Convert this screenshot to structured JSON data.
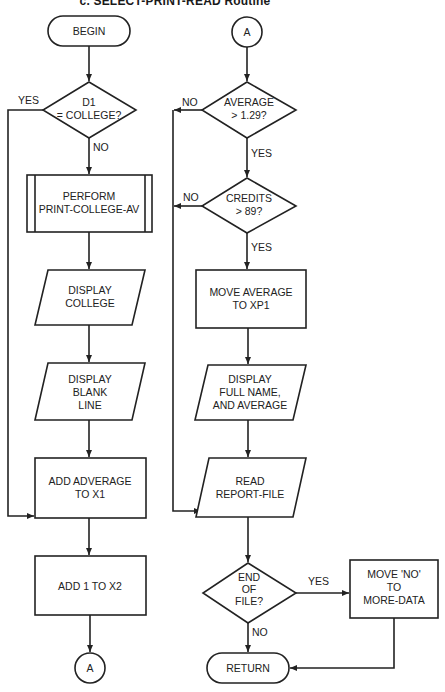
{
  "title": "c. SELECT-PRINT-READ Routine",
  "left_column": {
    "begin": "BEGIN",
    "decision_d1": [
      "D1",
      "= COLLEGE?"
    ],
    "decision_d1_yes": "YES",
    "decision_d1_no": "NO",
    "perform": [
      "PERFORM",
      "PRINT-COLLEGE-AV"
    ],
    "display_college": [
      "DISPLAY",
      "COLLEGE"
    ],
    "display_blank": [
      "DISPLAY",
      "BLANK",
      "LINE"
    ],
    "add_average": [
      "ADD ADVERAGE",
      "TO X1"
    ],
    "add_one": "ADD 1 TO X2",
    "connector_out": "A"
  },
  "right_column": {
    "connector_in": "A",
    "decision_average": [
      "AVERAGE",
      "> 1.29?"
    ],
    "decision_average_no": "NO",
    "decision_average_yes": "YES",
    "decision_credits": [
      "CREDITS",
      "> 89?"
    ],
    "decision_credits_no": "NO",
    "decision_credits_yes": "YES",
    "move_average": [
      "MOVE AVERAGE",
      "TO XP1"
    ],
    "display_full": [
      "DISPLAY",
      "FULL NAME,",
      "AND AVERAGE"
    ],
    "read_file": [
      "READ",
      "REPORT-FILE"
    ],
    "decision_eof": [
      "END",
      "OF",
      "FILE?"
    ],
    "decision_eof_yes": "YES",
    "decision_eof_no": "NO",
    "move_no": [
      "MOVE 'NO'",
      "TO",
      "MORE-DATA"
    ],
    "return": "RETURN"
  }
}
